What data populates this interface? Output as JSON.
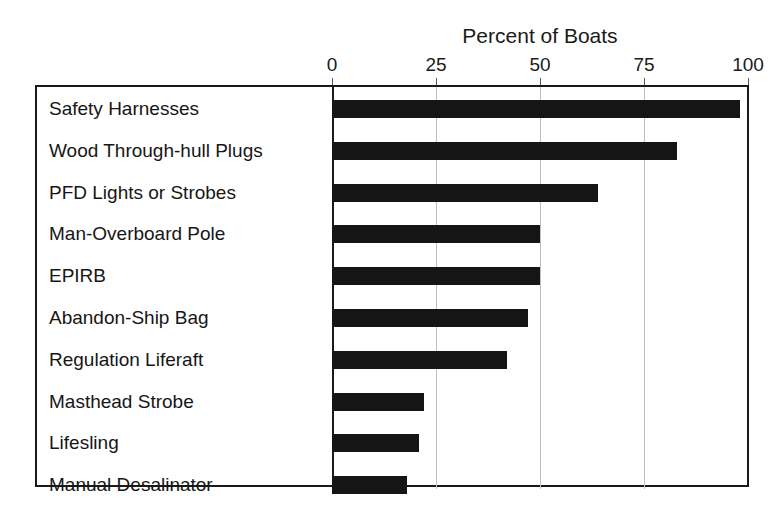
{
  "chart_data": {
    "type": "bar",
    "orientation": "horizontal",
    "title": "Percent of Boats",
    "xlabel": "",
    "ylabel": "",
    "xlim": [
      0,
      100
    ],
    "xticks": [
      0,
      25,
      50,
      75,
      100
    ],
    "xtick_labels": [
      "0",
      "25",
      "50",
      "75",
      "100"
    ],
    "grid": true,
    "legend": false,
    "categories": [
      "Safety Harnesses",
      "Wood Through-hull Plugs",
      "PFD Lights or Strobes",
      "Man-Overboard Pole",
      "EPIRB",
      "Abandon-Ship Bag",
      "Regulation Liferaft",
      "Masthead Strobe",
      "Lifesling",
      "Manual Desalinator"
    ],
    "values": [
      98,
      83,
      64,
      50,
      50,
      47,
      42,
      22,
      21,
      18
    ],
    "bar_color": "#151515",
    "grid_color": "#bfbfbf",
    "frame_color": "#1a1a1a"
  }
}
